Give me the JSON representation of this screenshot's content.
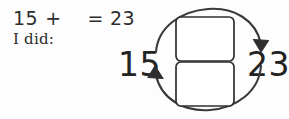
{
  "worksheet": {
    "problem": {
      "first_addend": "15",
      "operator": "+",
      "blank": "",
      "equals": "=",
      "sum": "23"
    },
    "method_label": "I did:",
    "diagram": {
      "start_value": "15",
      "end_value": "23",
      "boxes": [
        {
          "label": ""
        },
        {
          "label": ""
        }
      ],
      "arrows": [
        {
          "name": "forward-arrow",
          "direction": "clockwise-top",
          "from": "15",
          "to": "23"
        },
        {
          "name": "return-arrow",
          "direction": "counterclockwise-bottom",
          "from": "23",
          "to": "15"
        }
      ]
    }
  },
  "colors": {
    "ink": "#2d2d2d",
    "stroke": "#3a3a3a",
    "background": "#fdfdfd"
  }
}
